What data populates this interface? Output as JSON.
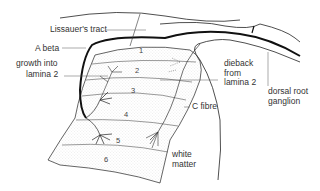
{
  "diagram": {
    "type": "anatomical-illustration",
    "labels": {
      "lissauer": "Lissauer's tract",
      "abeta": "A beta",
      "growth_line1": "growth into",
      "growth_line2": "lamina 2",
      "dieback_line1": "dieback",
      "dieback_line2": "from",
      "dieback_line3": "lamina 2",
      "drg_line1": "dorsal root",
      "drg_line2": "ganglion",
      "cfibre": "C fibre",
      "white_line1": "white",
      "white_line2": "matter"
    },
    "laminae": [
      "1",
      "2",
      "3",
      "4",
      "5",
      "6"
    ],
    "colors": {
      "line": "#222222",
      "text": "#333333",
      "stipple": "#bbbbbb",
      "background": "#ffffff"
    }
  }
}
